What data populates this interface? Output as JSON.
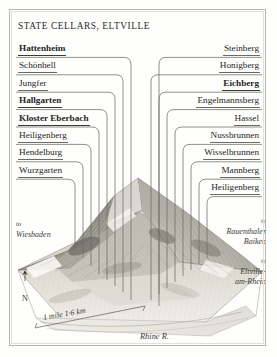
{
  "map": {
    "title": "STATE CELLARS, ELTVILLE",
    "vineyards_left": [
      {
        "name": "Hattenheim",
        "emphasis": true
      },
      {
        "name": "Schönhell",
        "emphasis": false
      },
      {
        "name": "Jungfer",
        "emphasis": false
      },
      {
        "name": "Hallgarten",
        "emphasis": true
      },
      {
        "name": "Kloster Eberbach",
        "emphasis": true
      },
      {
        "name": "Heiligenberg",
        "emphasis": false
      },
      {
        "name": "Hendelburg",
        "emphasis": false
      },
      {
        "name": "Wurzgarten",
        "emphasis": false
      }
    ],
    "vineyards_right": [
      {
        "name": "Steinberg",
        "emphasis": false
      },
      {
        "name": "Honigberg",
        "emphasis": false
      },
      {
        "name": "Eichberg",
        "emphasis": true
      },
      {
        "name": "Engelmannsberg",
        "emphasis": false
      },
      {
        "name": "Hassel",
        "emphasis": false
      },
      {
        "name": "Nussbrunnen",
        "emphasis": false
      },
      {
        "name": "Wisselbrunnen",
        "emphasis": false
      },
      {
        "name": "Mannberg",
        "emphasis": false
      },
      {
        "name": "Heiligenberg",
        "emphasis": false
      }
    ],
    "annotations": {
      "to_label": "to",
      "wiesbaden": "Wiesbaden",
      "rauenthal_line1": "Rauenthaler",
      "rauenthal_line2": "Baiken",
      "eltville_line1": "Eltville-",
      "eltville_line2": "am-Rhein",
      "river": "Rhine R.",
      "north": "N",
      "scale": "1 mile 1·6 km"
    },
    "colors": {
      "ink": "#2b2b2b",
      "rule": "#6c6a64",
      "frame": "#b9b6ae",
      "paper": "#fefefd",
      "terrain_dark": "#55544e",
      "terrain_light": "#cfccc4"
    }
  }
}
